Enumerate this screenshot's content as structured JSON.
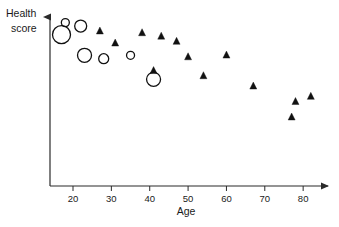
{
  "chart_data": {
    "type": "scatter",
    "title": "",
    "subtitle": "",
    "xlabel": "Age",
    "ylabel": "Health score",
    "ylabel_line1": "Health",
    "ylabel_line2": "score",
    "xlim": [
      14,
      87
    ],
    "ylim": [
      0,
      100
    ],
    "grid": false,
    "legend_position": "none",
    "x_ticks": [
      20,
      30,
      40,
      50,
      60,
      70,
      80
    ],
    "x_tick_labels": [
      "20",
      "30",
      "40",
      "50",
      "60",
      "70",
      "80"
    ],
    "y_ticks": [],
    "y_tick_labels": [],
    "y_axis_has_arrow": true,
    "x_axis_has_arrow": true,
    "series": [
      {
        "name": "open-circle-group",
        "marker": "open-circle",
        "color": "#111111",
        "points": [
          {
            "x": 18,
            "y": 95,
            "size": 4
          },
          {
            "x": 22,
            "y": 93,
            "size": 6
          },
          {
            "x": 17,
            "y": 88,
            "size": 9
          },
          {
            "x": 23,
            "y": 76,
            "size": 7
          },
          {
            "x": 28,
            "y": 74,
            "size": 5
          },
          {
            "x": 35,
            "y": 76,
            "size": 4
          },
          {
            "x": 41,
            "y": 62,
            "size": 7
          }
        ]
      },
      {
        "name": "filled-triangle-group",
        "marker": "filled-triangle",
        "color": "#111111",
        "points": [
          {
            "x": 27,
            "y": 90
          },
          {
            "x": 31,
            "y": 83
          },
          {
            "x": 38,
            "y": 89
          },
          {
            "x": 43,
            "y": 87
          },
          {
            "x": 41,
            "y": 67
          },
          {
            "x": 47,
            "y": 84
          },
          {
            "x": 50,
            "y": 75
          },
          {
            "x": 60,
            "y": 76
          },
          {
            "x": 54,
            "y": 64
          },
          {
            "x": 67,
            "y": 58
          },
          {
            "x": 78,
            "y": 49
          },
          {
            "x": 82,
            "y": 52
          },
          {
            "x": 77,
            "y": 40
          }
        ]
      }
    ]
  }
}
